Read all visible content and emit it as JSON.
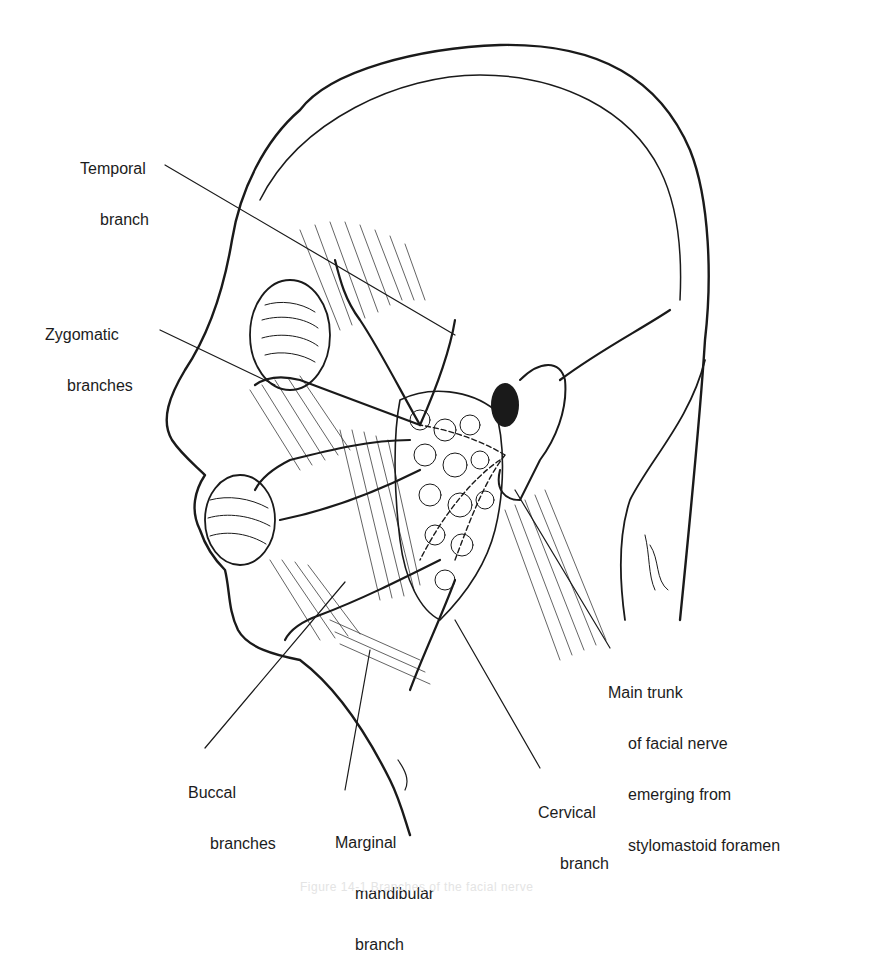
{
  "figure": {
    "caption": "Figure 14-1 Branches of the facial nerve"
  },
  "labels": {
    "temporal": {
      "line1": "Temporal",
      "line2": "branch"
    },
    "zygomatic": {
      "line1": "Zygomatic",
      "line2": "branches"
    },
    "main_trunk": {
      "line1": "Main trunk",
      "line2": "of facial nerve",
      "line3": "emerging from",
      "line4": "stylomastoid foramen"
    },
    "buccal": {
      "line1": "Buccal",
      "line2": "branches"
    },
    "marginal_mandibular": {
      "line1": "Marginal",
      "line2": "mandibular",
      "line3": "branch"
    },
    "cervical": {
      "line1": "Cervical",
      "line2": "branch"
    }
  },
  "colors": {
    "ink": "#1a1a1a",
    "paper": "#ffffff"
  }
}
